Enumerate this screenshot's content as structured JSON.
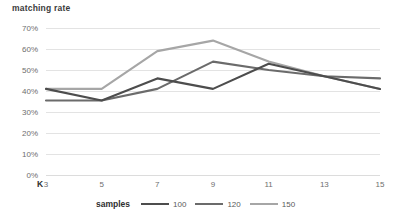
{
  "chart_data": {
    "type": "line",
    "title": "",
    "ylabel": "matching rate",
    "xlabel": "K",
    "legend_title": "samples",
    "legend_position": "bottom",
    "grid": true,
    "x": [
      3,
      5,
      7,
      9,
      11,
      13,
      15
    ],
    "xtick_labels": [
      "3",
      "5",
      "7",
      "9",
      "11",
      "13",
      "15"
    ],
    "ytick_labels": [
      "70%",
      "60%",
      "50%",
      "40%",
      "30%",
      "20%",
      "10%",
      "0%"
    ],
    "ytick_values": [
      70,
      60,
      50,
      40,
      30,
      20,
      10,
      0
    ],
    "ylim": [
      0,
      70
    ],
    "xlim": [
      3,
      15
    ],
    "series": [
      {
        "name": "100",
        "color": "#4d4d4d",
        "values": [
          41,
          35.5,
          46,
          41,
          53,
          47,
          41
        ]
      },
      {
        "name": "120",
        "color": "#6b6b6b",
        "values": [
          35.5,
          35.5,
          41,
          54,
          50,
          47,
          46
        ]
      },
      {
        "name": "150",
        "color": "#a6a6a6",
        "values": [
          41,
          41,
          59,
          64,
          54,
          47,
          41
        ]
      }
    ]
  },
  "colors": {
    "gridline": "#e3e3e3",
    "tick_text": "#6e6e6e",
    "title_text": "#3b3b3b",
    "background": "#ffffff"
  }
}
